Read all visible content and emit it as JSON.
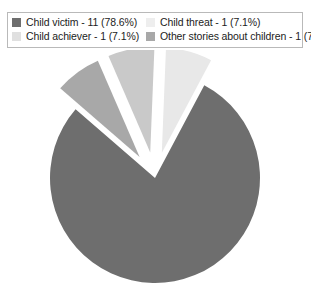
{
  "legend": {
    "entries": [
      {
        "label": "Child victim - 11 (78.6%)",
        "color": "#6e6e6e",
        "name": "child-victim"
      },
      {
        "label": "Child threat - 1 (7.1%)",
        "color": "#eeeeee",
        "name": "child-threat"
      },
      {
        "label": "Child achiever - 1 (7.1%)",
        "color": "#e0e0e0",
        "name": "child-achiever"
      },
      {
        "label": "Other stories about children - 1 (7.1%)",
        "color": "#a8a8a8",
        "name": "other-stories-about-children"
      }
    ]
  },
  "chart_data": {
    "type": "pie",
    "title": "",
    "labels": [
      "Child victim",
      "Other stories about children",
      "Child achiever",
      "Child threat"
    ],
    "values": [
      11,
      1,
      1,
      1
    ],
    "percentages": [
      78.6,
      7.1,
      7.1,
      7.1
    ],
    "legend_text": [
      "Child victim - 11 (78.6%)",
      "Other stories about children - 1 (7.1%)",
      "Child achiever - 1 (7.1%)",
      "Child threat - 1 (7.1%)"
    ],
    "colors": [
      "#6e6e6e",
      "#a8a8a8",
      "#c9c9c9",
      "#e8e8e8"
    ],
    "total": 14,
    "exploded": [
      false,
      true,
      true,
      true
    ],
    "legend_position": "top",
    "grid": false
  }
}
